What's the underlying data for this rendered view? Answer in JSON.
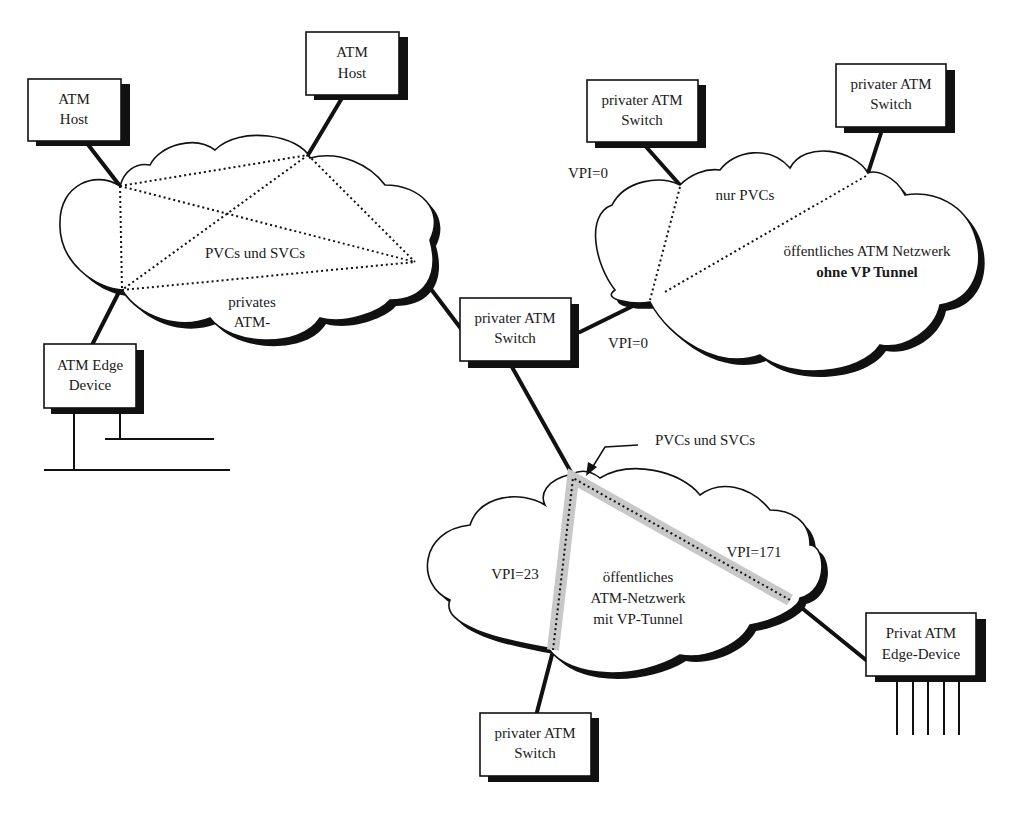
{
  "diagram": {
    "nodes": {
      "atm_host_left": {
        "line1": "ATM",
        "line2": "Host"
      },
      "atm_host_top": {
        "line1": "ATM",
        "line2": "Host"
      },
      "atm_edge_device": {
        "line1": "ATM Edge",
        "line2": "Device"
      },
      "private_switch_center": {
        "line1": "privater ATM",
        "line2": "Switch"
      },
      "private_switch_top_left": {
        "line1": "privater ATM",
        "line2": "Switch"
      },
      "private_switch_top_right": {
        "line1": "privater ATM",
        "line2": "Switch"
      },
      "private_switch_bottom": {
        "line1": "privater ATM",
        "line2": "Switch"
      },
      "private_edge_device": {
        "line1": "Privat ATM",
        "line2": "Edge-Device"
      }
    },
    "clouds": {
      "private_network": {
        "connections_label": "PVCs und SVCs",
        "name_line1": "privates",
        "name_line2": "ATM-"
      },
      "public_no_tunnel": {
        "connections_label": "nur PVCs",
        "name_line1": "öffentliches ATM Netzwerk",
        "name_line2": "ohne VP Tunnel"
      },
      "public_with_tunnel": {
        "connections_label": "PVCs und SVCs",
        "name_line1": "öffentliches",
        "name_line2": "ATM-Netzwerk",
        "name_line3": "mit VP-Tunnel"
      }
    },
    "vpi_labels": {
      "top_left_switch": "VPI=0",
      "center_switch": "VPI=0",
      "tunnel_left": "VPI=23",
      "tunnel_right": "VPI=171"
    },
    "colors": {
      "line": "#111111",
      "tunnel_highlight": "#c8c8c8",
      "background": "#ffffff"
    }
  }
}
